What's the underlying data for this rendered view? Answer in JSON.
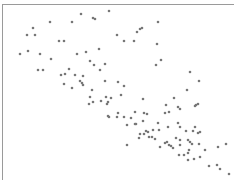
{
  "chart_data": {
    "type": "scatter",
    "title": "",
    "xlabel": "",
    "ylabel": "",
    "grid": false,
    "legend": null,
    "marker_color": "#777777",
    "axes": {
      "top_border": true,
      "left_border": true,
      "tick_labels": false
    },
    "trend": "negative correlation",
    "points_px": [
      [
        20,
        54
      ],
      [
        28,
        51
      ],
      [
        27,
        35
      ],
      [
        33,
        28
      ],
      [
        35,
        35
      ],
      [
        38,
        70
      ],
      [
        43,
        70
      ],
      [
        40,
        54
      ],
      [
        50,
        22
      ],
      [
        51,
        59
      ],
      [
        59,
        41
      ],
      [
        64,
        41
      ],
      [
        72,
        22
      ],
      [
        77,
        54
      ],
      [
        81,
        14
      ],
      [
        86,
        52
      ],
      [
        93,
        18
      ],
      [
        95,
        19
      ],
      [
        90,
        61
      ],
      [
        94,
        65
      ],
      [
        99,
        49
      ],
      [
        100,
        70
      ],
      [
        105,
        64
      ],
      [
        109,
        11
      ],
      [
        117,
        35
      ],
      [
        124,
        41
      ],
      [
        134,
        41
      ],
      [
        137,
        32
      ],
      [
        140,
        29
      ],
      [
        142,
        28
      ],
      [
        158,
        22
      ],
      [
        157,
        44
      ],
      [
        156,
        65
      ],
      [
        161,
        60
      ],
      [
        69,
        69
      ],
      [
        61,
        75
      ],
      [
        65,
        74
      ],
      [
        75,
        75
      ],
      [
        83,
        76
      ],
      [
        64,
        84
      ],
      [
        72,
        88
      ],
      [
        80,
        81
      ],
      [
        82,
        83
      ],
      [
        83,
        85
      ],
      [
        92,
        90
      ],
      [
        90,
        97
      ],
      [
        93,
        102
      ],
      [
        89,
        104
      ],
      [
        101,
        101
      ],
      [
        105,
        81
      ],
      [
        106,
        97
      ],
      [
        108,
        102
      ],
      [
        107,
        104
      ],
      [
        111,
        98
      ],
      [
        118,
        82
      ],
      [
        121,
        95
      ],
      [
        124,
        86
      ],
      [
        118,
        113
      ],
      [
        109,
        117
      ],
      [
        117,
        117
      ],
      [
        124,
        117
      ],
      [
        127,
        125
      ],
      [
        131,
        118
      ],
      [
        136,
        124
      ],
      [
        135,
        112
      ],
      [
        143,
        99
      ],
      [
        144,
        113
      ],
      [
        147,
        114
      ],
      [
        143,
        121
      ],
      [
        148,
        132
      ],
      [
        144,
        134
      ],
      [
        153,
        130
      ],
      [
        155,
        139
      ],
      [
        139,
        138
      ],
      [
        149,
        137
      ],
      [
        159,
        130
      ],
      [
        166,
        105
      ],
      [
        169,
        112
      ],
      [
        165,
        113
      ],
      [
        158,
        123
      ],
      [
        168,
        127
      ],
      [
        174,
        98
      ],
      [
        178,
        107
      ],
      [
        180,
        109
      ],
      [
        178,
        123
      ],
      [
        180,
        127
      ],
      [
        176,
        138
      ],
      [
        190,
        72
      ],
      [
        187,
        90
      ],
      [
        199,
        81
      ],
      [
        196,
        105
      ],
      [
        198,
        104
      ],
      [
        195,
        106
      ],
      [
        195,
        127
      ],
      [
        186,
        131
      ],
      [
        193,
        131
      ],
      [
        198,
        133
      ],
      [
        200,
        132
      ],
      [
        188,
        140
      ],
      [
        190,
        142
      ],
      [
        192,
        144
      ],
      [
        180,
        140
      ],
      [
        167,
        142
      ],
      [
        169,
        145
      ],
      [
        171,
        146
      ],
      [
        173,
        148
      ],
      [
        179,
        155
      ],
      [
        184,
        155
      ],
      [
        189,
        150
      ],
      [
        188,
        153
      ],
      [
        199,
        144
      ],
      [
        194,
        159
      ],
      [
        200,
        157
      ],
      [
        205,
        150
      ],
      [
        209,
        166
      ],
      [
        218,
        147
      ],
      [
        217,
        165
      ],
      [
        220,
        169
      ],
      [
        226,
        144
      ],
      [
        229,
        174
      ],
      [
        108,
        116
      ],
      [
        127,
        145
      ],
      [
        135,
        124
      ],
      [
        140,
        134
      ],
      [
        146,
        131
      ],
      [
        152,
        137
      ],
      [
        160,
        147
      ],
      [
        165,
        143
      ],
      [
        180,
        145
      ],
      [
        188,
        160
      ]
    ]
  }
}
